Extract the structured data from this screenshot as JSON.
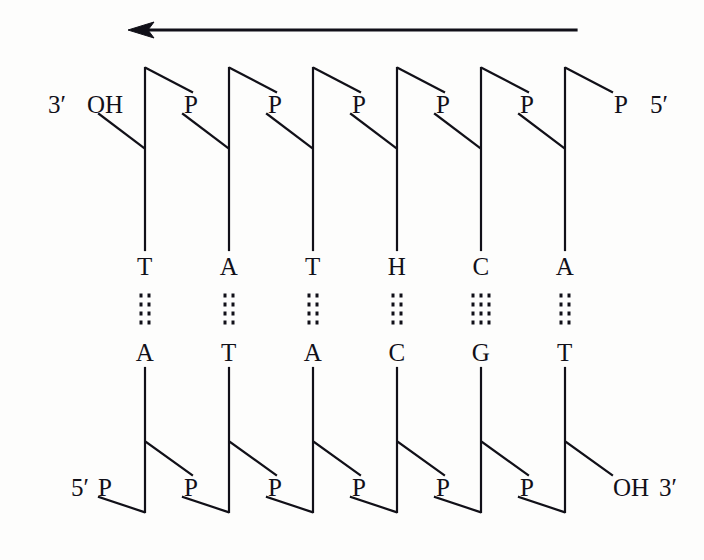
{
  "figure": {
    "background_color": "#fdfdfc",
    "ink_color": "#111018"
  },
  "arrow": {
    "name": "direction-arrow",
    "direction": "left",
    "x_start": 576,
    "x_end": 128,
    "y": 30
  },
  "top_strand": {
    "left_end_label": "3′",
    "left_group_label": "OH",
    "right_group_label": "P",
    "right_end_label": "5′",
    "phosphate_labels": [
      "P",
      "P",
      "P",
      "P",
      "P"
    ],
    "bases": [
      "T",
      "A",
      "T",
      "H",
      "C",
      "A"
    ]
  },
  "bottom_strand": {
    "left_end_label": "5′",
    "left_group_label": "P",
    "right_group_label": "OH",
    "right_end_label": "3′",
    "phosphate_labels": [
      "P",
      "P",
      "P",
      "P",
      "P"
    ],
    "bases": [
      "A",
      "T",
      "A",
      "C",
      "G",
      "T"
    ]
  },
  "base_pairs": [
    {
      "top": "T",
      "bottom": "A",
      "hydrogen_bonds": 2
    },
    {
      "top": "A",
      "bottom": "T",
      "hydrogen_bonds": 2
    },
    {
      "top": "T",
      "bottom": "A",
      "hydrogen_bonds": 2
    },
    {
      "top": "H",
      "bottom": "C",
      "hydrogen_bonds": 2
    },
    {
      "top": "C",
      "bottom": "G",
      "hydrogen_bonds": 3
    },
    {
      "top": "A",
      "bottom": "T",
      "hydrogen_bonds": 2
    }
  ],
  "geometry": {
    "column_x": [
      145,
      229,
      313,
      397,
      481,
      565
    ],
    "top_backbone_y_top": 68,
    "top_backbone_y_bottom": 250,
    "bottom_backbone_y_top": 368,
    "bottom_backbone_y_bottom": 512,
    "top_base_y": 266,
    "bottom_base_y": 352,
    "hbond_y": 309,
    "top_p_label_y": 104,
    "bottom_p_label_y": 487
  }
}
